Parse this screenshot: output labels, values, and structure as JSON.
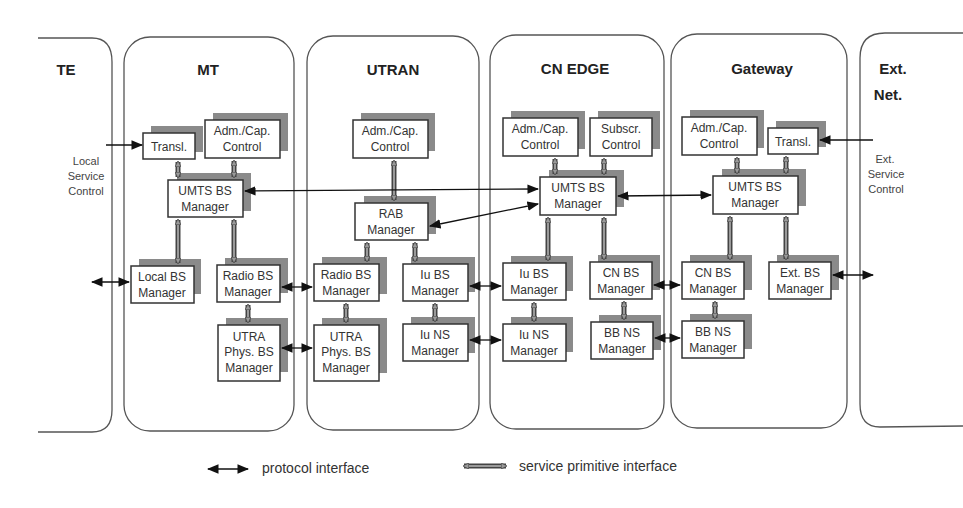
{
  "columns": [
    {
      "id": "te",
      "title": "TE"
    },
    {
      "id": "mt",
      "title": "MT"
    },
    {
      "id": "utran",
      "title": "UTRAN"
    },
    {
      "id": "cn_edge",
      "title": "CN EDGE"
    },
    {
      "id": "gateway",
      "title": "Gateway"
    },
    {
      "id": "ext_net",
      "title": "Ext.",
      "title2": "Net."
    }
  ],
  "side_labels": {
    "te": [
      "Local",
      "Service",
      "Control"
    ],
    "ext": [
      "Ext.",
      "Service",
      "Control"
    ]
  },
  "boxes": {
    "mt_transl": [
      "Transl."
    ],
    "mt_admcap": [
      "Adm./Cap.",
      "Control"
    ],
    "mt_umts": [
      "UMTS BS",
      "Manager"
    ],
    "mt_local": [
      "Local BS",
      "Manager"
    ],
    "mt_radio": [
      "Radio BS",
      "Manager"
    ],
    "mt_utra": [
      "UTRA",
      "Phys. BS",
      "Manager"
    ],
    "utran_admcap": [
      "Adm./Cap.",
      "Control"
    ],
    "utran_rab": [
      "RAB",
      "Manager"
    ],
    "utran_radio": [
      "Radio BS",
      "Manager"
    ],
    "utran_iubs": [
      "Iu BS",
      "Manager"
    ],
    "utran_utra": [
      "UTRA",
      "Phys. BS",
      "Manager"
    ],
    "utran_iuns": [
      "Iu NS",
      "Manager"
    ],
    "cn_admcap": [
      "Adm./Cap.",
      "Control"
    ],
    "cn_subscr": [
      "Subscr.",
      "Control"
    ],
    "cn_umts": [
      "UMTS BS",
      "Manager"
    ],
    "cn_iubs": [
      "Iu BS",
      "Manager"
    ],
    "cn_cnbs": [
      "CN BS",
      "Manager"
    ],
    "cn_iuns": [
      "Iu NS",
      "Manager"
    ],
    "cn_bbns": [
      "BB NS",
      "Manager"
    ],
    "gw_admcap": [
      "Adm./Cap.",
      "Control"
    ],
    "gw_transl": [
      "Transl."
    ],
    "gw_umts": [
      "UMTS BS",
      "Manager"
    ],
    "gw_cnbs": [
      "CN BS",
      "Manager"
    ],
    "gw_extbs": [
      "Ext. BS",
      "Manager"
    ],
    "gw_bbns": [
      "BB NS",
      "Manager"
    ]
  },
  "legend": {
    "protocol": "protocol interface",
    "service": "service primitive interface"
  },
  "colors": {
    "line": "#111111",
    "shadow": "#8a8a8a",
    "panel_border": "#555555"
  }
}
